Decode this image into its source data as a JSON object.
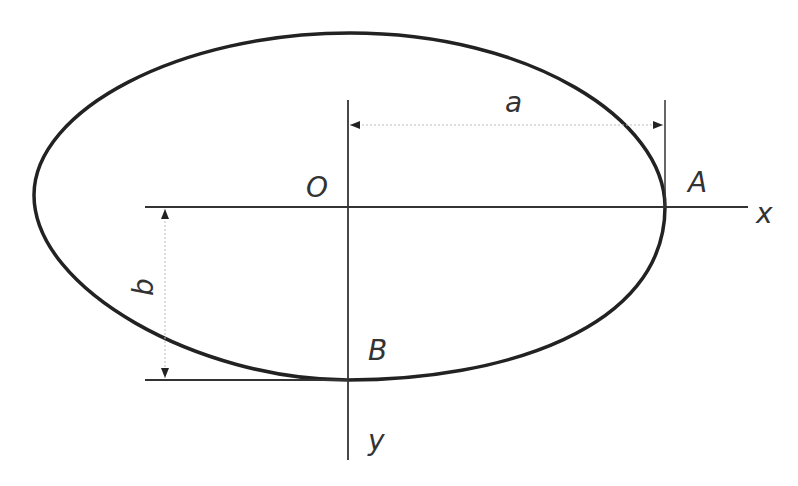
{
  "diagram": {
    "title": "",
    "labels": {
      "origin": "O",
      "point_a": "A",
      "point_b": "B",
      "x_axis": "x",
      "y_axis": "y",
      "semi_major": "a",
      "semi_minor": "b"
    },
    "colors": {
      "stroke": "#222222",
      "dimension_line": "#bbbbbb",
      "text": "#333333",
      "background": "#ffffff"
    }
  }
}
